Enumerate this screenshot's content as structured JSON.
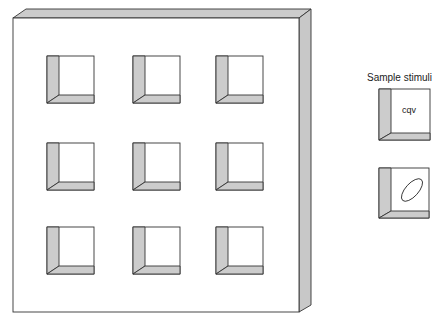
{
  "figure": {
    "board": {
      "rows": 3,
      "cols": 3,
      "windows": [
        {
          "row": 1,
          "col": 1
        },
        {
          "row": 1,
          "col": 2
        },
        {
          "row": 1,
          "col": 3
        },
        {
          "row": 2,
          "col": 1
        },
        {
          "row": 2,
          "col": 2
        },
        {
          "row": 2,
          "col": 3
        },
        {
          "row": 3,
          "col": 1
        },
        {
          "row": 3,
          "col": 2
        },
        {
          "row": 3,
          "col": 3
        }
      ]
    },
    "sample": {
      "title": "Sample stimuli",
      "stimuli": [
        {
          "type": "text",
          "content": "cqv"
        },
        {
          "type": "shape",
          "content": "ellipse"
        }
      ]
    },
    "colors": {
      "line": "#333333",
      "shade": "#cccccc",
      "background": "#ffffff"
    }
  }
}
